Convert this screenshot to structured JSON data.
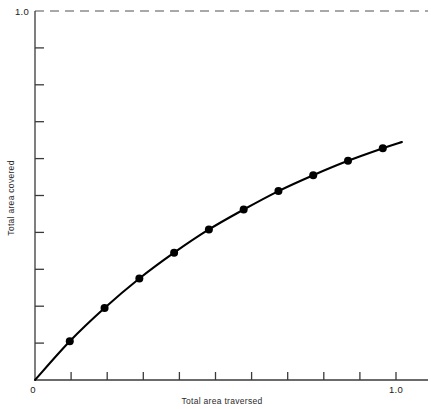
{
  "chart_data": {
    "type": "line",
    "title": "",
    "subtitle": "",
    "xlabel": "Total area traversed",
    "ylabel": "Total area covered",
    "xlim": [
      0,
      1.13
    ],
    "ylim": [
      0,
      1.0
    ],
    "grid": false,
    "legend": null,
    "x": [
      0.1,
      0.2,
      0.3,
      0.4,
      0.5,
      0.6,
      0.7,
      0.8,
      0.9,
      1.0
    ],
    "values": [
      0.105,
      0.195,
      0.275,
      0.345,
      0.408,
      0.462,
      0.512,
      0.555,
      0.594,
      0.628
    ],
    "series": [
      {
        "name": "Total area covered",
        "values": [
          0.105,
          0.195,
          0.275,
          0.345,
          0.408,
          0.462,
          0.512,
          0.555,
          0.594,
          0.628
        ]
      }
    ],
    "annotations": [
      {
        "name": "asymptote",
        "type": "horizontal-dashed-line",
        "y": 1.0,
        "label": "1.0"
      }
    ],
    "x_tick_values": [
      0,
      0.1,
      0.2,
      0.3,
      0.4,
      0.5,
      0.6,
      0.7,
      0.8,
      0.9,
      1.0
    ],
    "x_tick_labels": [
      "0",
      "",
      "",
      "",
      "",
      "",
      "",
      "",
      "",
      "",
      "1.0"
    ],
    "y_tick_values": [
      0,
      0.1,
      0.2,
      0.3,
      0.4,
      0.5,
      0.6,
      0.7,
      0.8,
      0.9,
      1.0
    ],
    "y_tick_labels": [
      "",
      "",
      "",
      "",
      "",
      "",
      "",
      "",
      "",
      "",
      "1.0"
    ],
    "marker": "filled-circle",
    "line_color": "#000000",
    "marker_color": "#000000",
    "dash_color": "#888888"
  },
  "axes": {
    "x_title": "Total area traversed",
    "y_title": "Total area covered"
  },
  "ticks": {
    "origin_label": "0",
    "x_max_label": "1.0",
    "y_max_label": "1.0"
  }
}
